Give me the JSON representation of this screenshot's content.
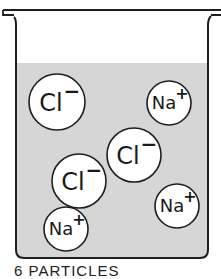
{
  "diagram": {
    "colors": {
      "liquid": "#d6d6d6",
      "outline": "#1e1e1e",
      "ion_fill": "#ffffff"
    },
    "ions": [
      {
        "symbol": "Cl",
        "charge": "−",
        "label": "Cl−",
        "cx": 57,
        "cy": 102,
        "r": 28
      },
      {
        "symbol": "Na",
        "charge": "+",
        "label": "Na+",
        "cx": 169,
        "cy": 103,
        "r": 22
      },
      {
        "symbol": "Cl",
        "charge": "−",
        "label": "Cl−",
        "cx": 134,
        "cy": 155,
        "r": 27
      },
      {
        "symbol": "Cl",
        "charge": "−",
        "label": "Cl−",
        "cx": 79,
        "cy": 181,
        "r": 27
      },
      {
        "symbol": "Na",
        "charge": "+",
        "label": "Na+",
        "cx": 177,
        "cy": 206,
        "r": 22
      },
      {
        "symbol": "Na",
        "charge": "+",
        "label": "Na+",
        "cx": 66,
        "cy": 229,
        "r": 22
      }
    ],
    "caption": "6 PARTICLES"
  }
}
